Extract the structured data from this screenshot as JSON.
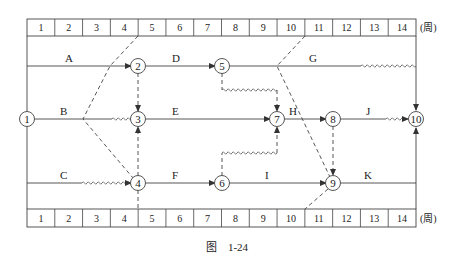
{
  "diagram": {
    "type": "time-scaled network diagram (double-code)",
    "unit_label": "(周)",
    "caption": "图　1-24",
    "top_scale": [
      "1",
      "2",
      "3",
      "4",
      "5",
      "6",
      "7",
      "8",
      "9",
      "10",
      "11",
      "12",
      "13",
      "14"
    ],
    "bottom_scale": [
      "1",
      "2",
      "3",
      "4",
      "5",
      "6",
      "7",
      "8",
      "9",
      "10",
      "11",
      "12",
      "13",
      "14"
    ],
    "nodes": [
      {
        "id": "1",
        "label": "1"
      },
      {
        "id": "2",
        "label": "2"
      },
      {
        "id": "3",
        "label": "3"
      },
      {
        "id": "4",
        "label": "4"
      },
      {
        "id": "5",
        "label": "5"
      },
      {
        "id": "6",
        "label": "6"
      },
      {
        "id": "7",
        "label": "7"
      },
      {
        "id": "8",
        "label": "8"
      },
      {
        "id": "9",
        "label": "9"
      },
      {
        "id": "10",
        "label": "10"
      }
    ],
    "activities": [
      {
        "name": "A",
        "from": "1",
        "to": "2",
        "start": 0,
        "end": 4
      },
      {
        "name": "B",
        "from": "1",
        "to": "3",
        "start": 0,
        "end": 2,
        "free_float": 2
      },
      {
        "name": "C",
        "from": "1",
        "to": "4",
        "start": 0,
        "end": 2,
        "free_float": 2
      },
      {
        "name": "D",
        "from": "2",
        "to": "5",
        "start": 4,
        "end": 7
      },
      {
        "name": "E",
        "from": "3",
        "to": "7",
        "start": 4,
        "end": 9
      },
      {
        "name": "F",
        "from": "4",
        "to": "6",
        "start": 4,
        "end": 7
      },
      {
        "name": "G",
        "from": "5",
        "to": "10",
        "start": 7,
        "end": 12,
        "free_float": 2
      },
      {
        "name": "H",
        "from": "7",
        "to": "8",
        "start": 9,
        "end": 11
      },
      {
        "name": "I",
        "from": "6",
        "to": "9",
        "start": 7,
        "end": 11
      },
      {
        "name": "J",
        "from": "8",
        "to": "10",
        "start": 11,
        "end": 13,
        "free_float": 1
      },
      {
        "name": "K",
        "from": "9",
        "to": "10",
        "start": 11,
        "end": 14
      }
    ],
    "dummies": [
      {
        "from": "2",
        "to": "3"
      },
      {
        "from": "4",
        "to": "3"
      },
      {
        "from": "5",
        "to": "7",
        "free_float": 2
      },
      {
        "from": "6",
        "to": "7",
        "free_float": 2
      },
      {
        "from": "8",
        "to": "9"
      }
    ],
    "check_lines": [
      {
        "name": "check-line-week-4",
        "top_week": 4,
        "bottom_week": 4
      },
      {
        "name": "check-line-week-10",
        "top_week": 10,
        "bottom_week": 10
      }
    ]
  }
}
